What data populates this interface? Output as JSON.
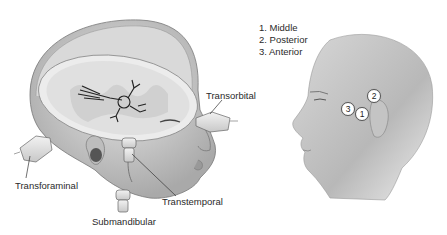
{
  "left_figure": {
    "description": "Cutaway head showing brain with transcranial Doppler probe windows",
    "labels": {
      "transorbital": "Transorbital",
      "transforaminal": "Transforaminal",
      "transtemporal": "Transtemporal",
      "submandibular": "Submandibular"
    }
  },
  "right_figure": {
    "description": "Side profile of head with numbered temporal window positions",
    "legend": [
      "1. Middle",
      "2. Posterior",
      "3. Anterior"
    ],
    "markers": [
      {
        "id": "1",
        "label": "1"
      },
      {
        "id": "2",
        "label": "2"
      },
      {
        "id": "3",
        "label": "3"
      }
    ]
  }
}
